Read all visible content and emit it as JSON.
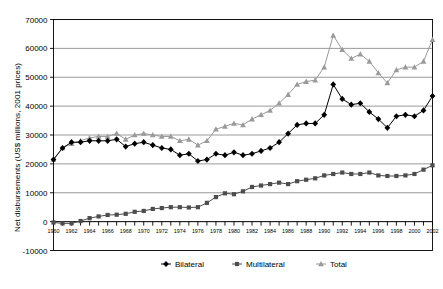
{
  "chart_data": {
    "type": "line",
    "title": "",
    "xlabel": "",
    "ylabel": "Net disbursements (US$ millions, 2001 prices)",
    "grid": true,
    "legend_position": "bottom",
    "xlim": [
      1960,
      2002
    ],
    "ylim": [
      -10000,
      70000
    ],
    "ytick_labels": [
      "70000",
      "60000",
      "50000",
      "40000",
      "30000",
      "20000",
      "10000",
      "0",
      "-10000"
    ],
    "ytick_values": [
      70000,
      60000,
      50000,
      40000,
      30000,
      20000,
      10000,
      0,
      -10000
    ],
    "xtick_labels": [
      "1960",
      "1962",
      "1964",
      "1966",
      "1968",
      "1970",
      "1972",
      "1974",
      "1976",
      "1978",
      "1980",
      "1982",
      "1984",
      "1986",
      "1988",
      "1990",
      "1992",
      "1994",
      "1996",
      "1998",
      "2000",
      "2002"
    ],
    "x": [
      1960,
      1961,
      1962,
      1963,
      1964,
      1965,
      1966,
      1967,
      1968,
      1969,
      1970,
      1971,
      1972,
      1973,
      1974,
      1975,
      1976,
      1977,
      1978,
      1979,
      1980,
      1981,
      1982,
      1983,
      1984,
      1985,
      1986,
      1987,
      1988,
      1989,
      1990,
      1991,
      1992,
      1993,
      1994,
      1995,
      1996,
      1997,
      1998,
      1999,
      2000,
      2001,
      2002
    ],
    "series": [
      {
        "name": "Bilateral",
        "marker": "diamond",
        "color": "#000000",
        "values": [
          21500,
          25500,
          27500,
          27500,
          28000,
          28000,
          28000,
          28500,
          26000,
          27000,
          27500,
          26500,
          25500,
          25000,
          23000,
          23500,
          21000,
          21500,
          23500,
          23000,
          24000,
          23000,
          23500,
          24500,
          25500,
          27500,
          30500,
          33500,
          34000,
          34000,
          37000,
          47500,
          42500,
          40500,
          41000,
          38000,
          35500,
          32500,
          36500,
          37000,
          36500,
          38500,
          43500
        ]
      },
      {
        "name": "Multilateral",
        "marker": "square",
        "color": "#4d4d4d",
        "values": [
          -300,
          -600,
          -600,
          200,
          1200,
          1800,
          2300,
          2400,
          2700,
          3400,
          3700,
          4400,
          4700,
          5000,
          5000,
          4900,
          5000,
          6500,
          8500,
          9800,
          9500,
          10500,
          12000,
          12500,
          13000,
          13500,
          13000,
          14000,
          14500,
          15000,
          16000,
          16500,
          17000,
          16500,
          16500,
          17000,
          16000,
          15800,
          15800,
          16000,
          16500,
          18000,
          19500
        ]
      },
      {
        "name": "Total",
        "marker": "triangle",
        "color": "#9a9a9a",
        "values": [
          21500,
          25500,
          27000,
          28000,
          29000,
          29500,
          29500,
          30500,
          28500,
          30000,
          30500,
          30000,
          29500,
          29500,
          28000,
          28500,
          26500,
          28000,
          32000,
          33000,
          34000,
          33500,
          35500,
          37000,
          38500,
          41000,
          44000,
          47500,
          48500,
          49000,
          53500,
          64500,
          59500,
          56500,
          58000,
          55500,
          51500,
          48000,
          52500,
          53500,
          53500,
          55500,
          63000
        ]
      }
    ]
  },
  "legend": {
    "entries": [
      {
        "label": "Bilateral",
        "marker": "diamond"
      },
      {
        "label": "Multilateral",
        "marker": "square"
      },
      {
        "label": "Total",
        "marker": "triangle"
      }
    ]
  }
}
